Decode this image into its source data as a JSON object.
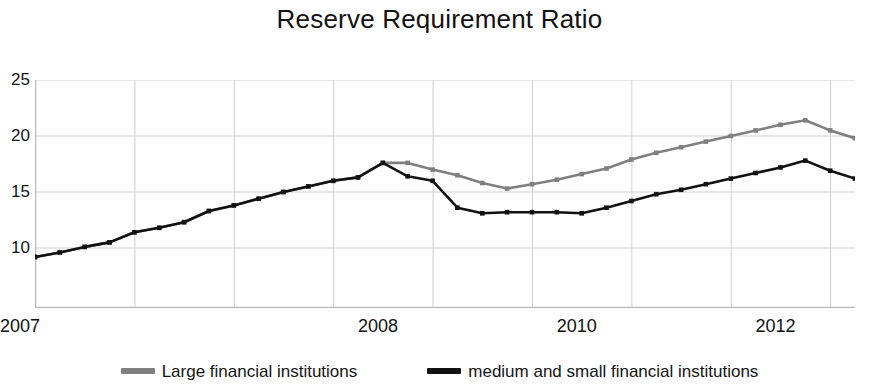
{
  "chart_data": {
    "type": "line",
    "title": "Reserve Requirement Ratio",
    "xlabel": "",
    "ylabel": "",
    "ylim": [
      0,
      25
    ],
    "y_ticks": [
      10,
      15,
      20,
      25
    ],
    "y_tick_labels": [
      "10",
      "15",
      "20",
      "25"
    ],
    "xlim": [
      0,
      33
    ],
    "x_tick_labels": [
      "2007",
      "2008",
      "2010",
      "2012"
    ],
    "x_tick_positions": [
      0,
      14,
      22,
      30
    ],
    "x_gridline_positions": [
      0,
      4,
      8,
      12,
      16,
      20,
      24,
      28,
      32
    ],
    "grid": true,
    "legend_position": "bottom",
    "series": [
      {
        "name": "Large financial institutions",
        "color": "#7f7f7f",
        "x": [
          0,
          1,
          2,
          3,
          4,
          5,
          6,
          7,
          8,
          9,
          10,
          11,
          12,
          13,
          14,
          15,
          16,
          17,
          18,
          19,
          20,
          21,
          22,
          23,
          24,
          25,
          26,
          27,
          28,
          29,
          30,
          31,
          32,
          33
        ],
        "values": [
          9.2,
          9.6,
          10.1,
          10.5,
          11.4,
          11.8,
          12.3,
          13.3,
          13.8,
          14.4,
          15.0,
          15.5,
          16.0,
          16.3,
          17.6,
          17.6,
          17.0,
          16.5,
          15.8,
          15.3,
          15.7,
          16.1,
          16.6,
          17.1,
          17.9,
          18.5,
          19.0,
          19.5,
          20.0,
          20.5,
          21.0,
          21.4,
          20.5,
          19.8
        ]
      },
      {
        "name": "medium and small financial institutions",
        "color": "#111111",
        "x": [
          0,
          1,
          2,
          3,
          4,
          5,
          6,
          7,
          8,
          9,
          10,
          11,
          12,
          13,
          14,
          15,
          16,
          17,
          18,
          19,
          20,
          21,
          22,
          23,
          24,
          25,
          26,
          27,
          28,
          29,
          30,
          31,
          32,
          33
        ],
        "values": [
          9.2,
          9.6,
          10.1,
          10.5,
          11.4,
          11.8,
          12.3,
          13.3,
          13.8,
          14.4,
          15.0,
          15.5,
          16.0,
          16.3,
          17.6,
          16.4,
          16.0,
          13.6,
          13.1,
          13.2,
          13.2,
          13.2,
          13.1,
          13.6,
          14.2,
          14.8,
          15.2,
          15.7,
          16.2,
          16.7,
          17.2,
          17.8,
          16.9,
          16.2
        ]
      }
    ]
  },
  "axes": {
    "axis_color": "#b8b8b8",
    "grid_color": "#cfcfcf"
  },
  "legend": {
    "entries": [
      {
        "label": "Large financial institutions",
        "color": "#7f7f7f"
      },
      {
        "label": "medium and small financial institutions",
        "color": "#111111"
      }
    ]
  }
}
